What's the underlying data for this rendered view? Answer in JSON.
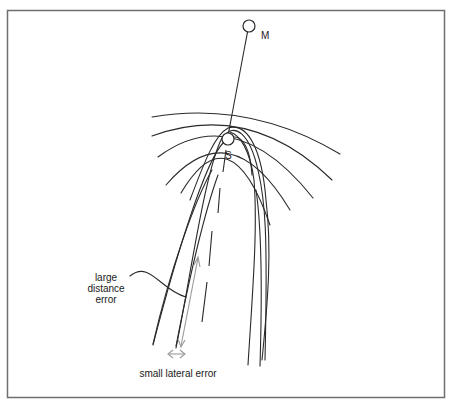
{
  "diagram": {
    "nodes": {
      "m": {
        "label": "M"
      },
      "s": {
        "label": "S"
      }
    },
    "annotations": {
      "distance_error_line1": "large",
      "distance_error_line2": "distance",
      "distance_error_line3": "error",
      "lateral_error": "small lateral error"
    },
    "colors": {
      "line": "#2a2a2a",
      "frame": "#6f6f6f",
      "error_arrow": "#9a9a9a",
      "background": "#ffffff"
    }
  }
}
